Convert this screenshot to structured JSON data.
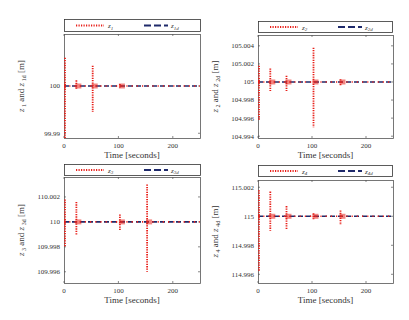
{
  "chart_data": [
    {
      "type": "line",
      "id": "z1",
      "xlabel": "Time [seconds]",
      "ylabel": "z_1 and z_1d [m]",
      "ylabel_parts": {
        "a": "z",
        "a_sub": "1",
        "mid": " and ",
        "b": "z",
        "b_sub": "1d",
        "unit": " [m]"
      },
      "xlim": [
        0,
        250
      ],
      "ylim": [
        99.989,
        100.011
      ],
      "xticks": [
        0,
        100,
        200
      ],
      "yticks": [
        99.99,
        100
      ],
      "ytick_labels": [
        "99.99",
        "100"
      ],
      "legend": [
        {
          "label": "z",
          "sub": "1",
          "style": "dotted",
          "color": "#e8201a"
        },
        {
          "label": "z",
          "sub": "1d",
          "style": "dashed",
          "color": "#1f2a6b"
        }
      ],
      "reference": 100,
      "spikes": [
        {
          "t": 0,
          "min": 99.989,
          "max": 100.006
        },
        {
          "t": 20,
          "min": 99.9992,
          "max": 100.0012
        },
        {
          "t": 50,
          "min": 99.9945,
          "max": 100.0043
        },
        {
          "t": 100,
          "min": 99.9997,
          "max": 100.0004
        }
      ],
      "frame": {
        "x": 64,
        "y": 34,
        "w": 136,
        "h": 104
      },
      "legend_box": {
        "x": 64,
        "y": 19,
        "w": 136,
        "h": 12
      }
    },
    {
      "type": "line",
      "id": "z2",
      "xlabel": "Time [seconds]",
      "ylabel": "z_2 and z_2d [m]",
      "ylabel_parts": {
        "a": "z",
        "a_sub": "2",
        "mid": " and ",
        "b": "z",
        "b_sub": "2d",
        "unit": " [m]"
      },
      "xlim": [
        0,
        250
      ],
      "ylim": [
        104.9938,
        105.0052
      ],
      "xticks": [
        0,
        100,
        200
      ],
      "yticks": [
        104.994,
        104.996,
        104.998,
        105,
        105.002,
        105.004
      ],
      "ytick_labels": [
        "104.994",
        "104.996",
        "104.998",
        "105",
        "105.002",
        "105.004"
      ],
      "legend": [
        {
          "label": "z",
          "sub": "2",
          "style": "dotted",
          "color": "#e8201a"
        },
        {
          "label": "z",
          "sub": "2d",
          "style": "dashed",
          "color": "#1f2a6b"
        }
      ],
      "reference": 105,
      "spikes": [
        {
          "t": 0,
          "min": 104.9958,
          "max": 105.0018
        },
        {
          "t": 20,
          "min": 104.999,
          "max": 105.0015
        },
        {
          "t": 50,
          "min": 104.999,
          "max": 105.0007
        },
        {
          "t": 100,
          "min": 104.995,
          "max": 105.0038
        },
        {
          "t": 150,
          "min": 104.9996,
          "max": 105.0003
        }
      ],
      "frame": {
        "x": 258,
        "y": 35,
        "w": 135,
        "h": 103
      },
      "legend_box": {
        "x": 258,
        "y": 21,
        "w": 134,
        "h": 11
      }
    },
    {
      "type": "line",
      "id": "z3",
      "xlabel": "Time [seconds]",
      "ylabel": "z_3 and z_3d [m]",
      "ylabel_parts": {
        "a": "z",
        "a_sub": "3",
        "mid": " and ",
        "b": "z",
        "b_sub": "3d",
        "unit": " [m]"
      },
      "xlim": [
        0,
        250
      ],
      "ylim": [
        109.9951,
        110.0036
      ],
      "xticks": [
        0,
        100,
        200
      ],
      "yticks": [
        109.996,
        109.998,
        110,
        110.002
      ],
      "ytick_labels": [
        "109.996",
        "109.998",
        "110",
        "110.002"
      ],
      "legend": [
        {
          "label": "z",
          "sub": "3",
          "style": "dotted",
          "color": "#e8201a"
        },
        {
          "label": "z",
          "sub": "3d",
          "style": "dashed",
          "color": "#1f2a6b"
        }
      ],
      "reference": 110,
      "spikes": [
        {
          "t": 0,
          "min": 109.998,
          "max": 110.0018
        },
        {
          "t": 20,
          "min": 109.9989,
          "max": 110.0016
        },
        {
          "t": 100,
          "min": 109.9993,
          "max": 110.0006
        },
        {
          "t": 150,
          "min": 109.996,
          "max": 110.003
        }
      ],
      "frame": {
        "x": 64,
        "y": 177,
        "w": 136,
        "h": 106
      },
      "legend_box": {
        "x": 64,
        "y": 164,
        "w": 136,
        "h": 11
      }
    },
    {
      "type": "line",
      "id": "z4",
      "xlabel": "Time [seconds]",
      "ylabel": "z_4 and z_4d [m]",
      "ylabel_parts": {
        "a": "z",
        "a_sub": "4",
        "mid": " and ",
        "b": "z",
        "b_sub": "4d",
        "unit": " [m]"
      },
      "xlim": [
        0,
        250
      ],
      "ylim": [
        114.9954,
        115.0025
      ],
      "xticks": [
        0,
        100,
        200
      ],
      "yticks": [
        114.996,
        114.998,
        115,
        115.002
      ],
      "ytick_labels": [
        "114.996",
        "114.998",
        "115",
        "115.002"
      ],
      "legend": [
        {
          "label": "z",
          "sub": "4",
          "style": "dotted",
          "color": "#e8201a"
        },
        {
          "label": "z",
          "sub": "4d",
          "style": "dashed",
          "color": "#1f2a6b"
        }
      ],
      "reference": 115,
      "spikes": [
        {
          "t": 0,
          "min": 114.9962,
          "max": 115.0018
        },
        {
          "t": 20,
          "min": 114.999,
          "max": 115.0017
        },
        {
          "t": 50,
          "min": 114.9991,
          "max": 115.0007
        },
        {
          "t": 100,
          "min": 114.9998,
          "max": 115.0002
        },
        {
          "t": 150,
          "min": 114.9994,
          "max": 115.0004
        }
      ],
      "frame": {
        "x": 258,
        "y": 180,
        "w": 135,
        "h": 103
      },
      "legend_box": {
        "x": 258,
        "y": 165,
        "w": 134,
        "h": 11
      }
    }
  ],
  "colors": {
    "actual": "#e8201a",
    "desired": "#1f2a6b",
    "axis": "#555555"
  }
}
